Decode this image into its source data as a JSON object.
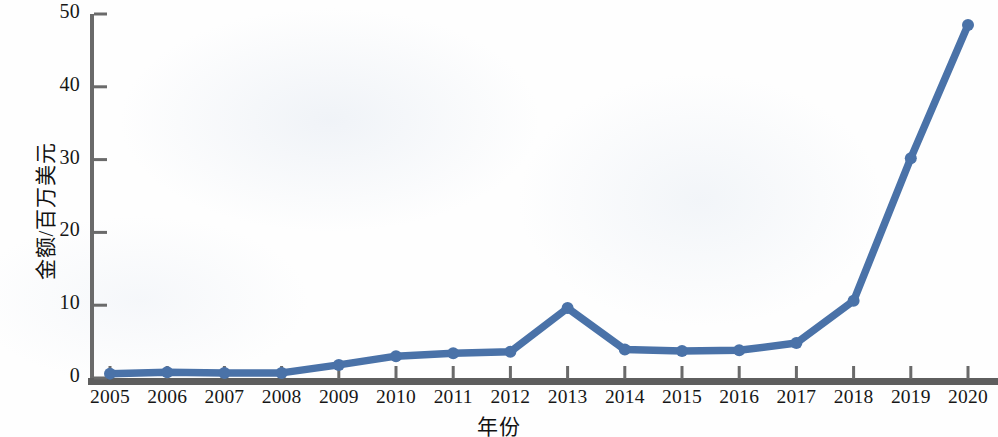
{
  "chart_data": {
    "type": "line",
    "title": "",
    "subtitle": "",
    "xlabel": "年份",
    "ylabel": "金额/百万美元",
    "x": [
      2005,
      2006,
      2007,
      2008,
      2009,
      2010,
      2011,
      2012,
      2013,
      2014,
      2015,
      2016,
      2017,
      2018,
      2019,
      2020
    ],
    "categories": [
      "2005",
      "2006",
      "2007",
      "2008",
      "2009",
      "2010",
      "2011",
      "2012",
      "2013",
      "2014",
      "2015",
      "2016",
      "2017",
      "2018",
      "2019",
      "2020"
    ],
    "values": [
      0.6,
      0.8,
      0.7,
      0.7,
      1.8,
      3.0,
      3.4,
      3.6,
      9.6,
      3.9,
      3.7,
      3.8,
      4.8,
      10.6,
      30.2,
      48.5
    ],
    "series": [
      {
        "name": "金额",
        "color": "#4a72a8",
        "values": [
          0.6,
          0.8,
          0.7,
          0.7,
          1.8,
          3.0,
          3.4,
          3.6,
          9.6,
          3.9,
          3.7,
          3.8,
          4.8,
          10.6,
          30.2,
          48.5
        ]
      }
    ],
    "xlim": [
      2005,
      2020
    ],
    "ylim": [
      0,
      50
    ],
    "ytick_labels": [
      "0",
      "10",
      "20",
      "30",
      "40",
      "50"
    ],
    "ytick_values": [
      0,
      10,
      20,
      30,
      40,
      50
    ],
    "xtick_labels": [
      "2005",
      "2006",
      "2007",
      "2008",
      "2009",
      "2010",
      "2011",
      "2012",
      "2013",
      "2014",
      "2015",
      "2016",
      "2017",
      "2018",
      "2019",
      "2020"
    ],
    "grid": false,
    "legend": null,
    "legend_position": "none",
    "marker": "circle",
    "line_color": "#4a72a8",
    "marker_color": "#4a72a8",
    "axis_color": "#575757",
    "text_color": "#161616",
    "background_color": "#fefefe"
  }
}
